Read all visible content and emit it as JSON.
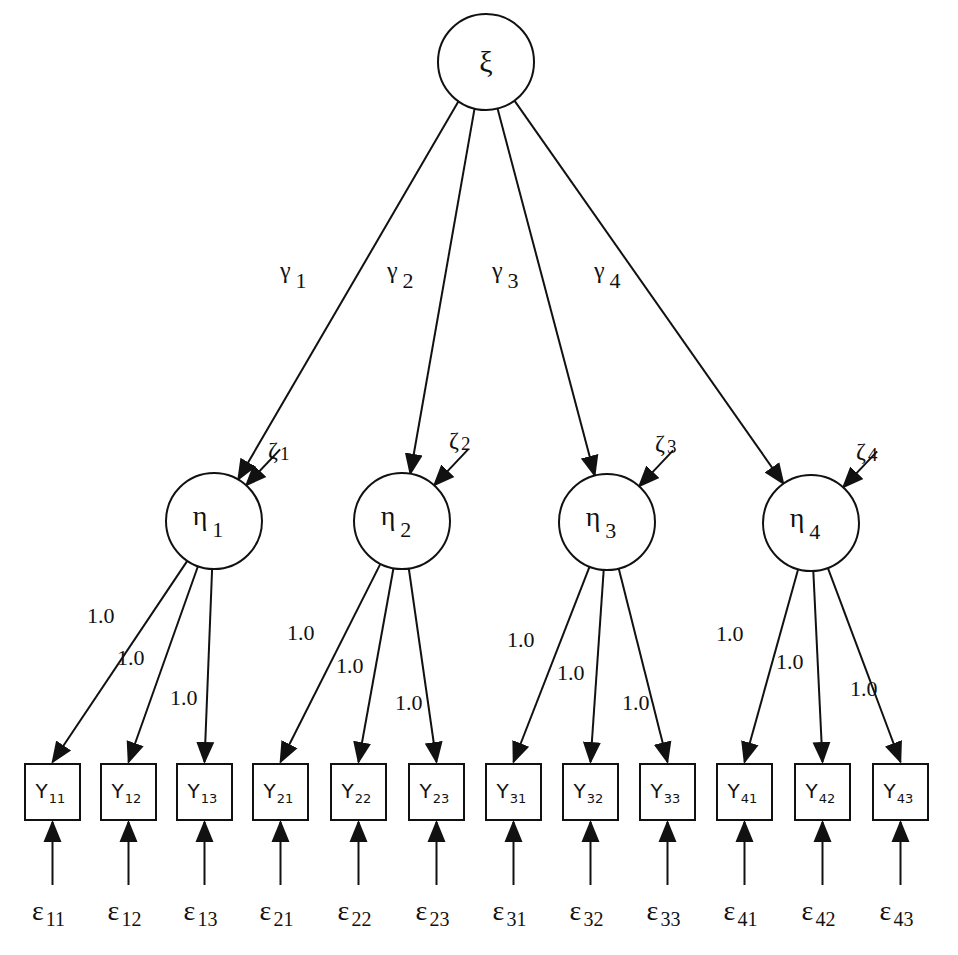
{
  "diagram": {
    "type": "second-order factor model (path diagram)",
    "higher_order_factor": {
      "id": "xi",
      "label": "ξ",
      "cx": 486,
      "cy": 62,
      "r": 48
    },
    "gamma_paths": [
      {
        "label": "γ",
        "sub": "1",
        "to": "eta1",
        "lx": 280,
        "ly": 278
      },
      {
        "label": "γ",
        "sub": "2",
        "to": "eta2",
        "lx": 387,
        "ly": 278
      },
      {
        "label": "γ",
        "sub": "3",
        "to": "eta3",
        "lx": 492,
        "ly": 278
      },
      {
        "label": "γ",
        "sub": "4",
        "to": "eta4",
        "lx": 594,
        "ly": 278
      }
    ],
    "first_order_factors": [
      {
        "id": "eta1",
        "label": "η",
        "sub": "1",
        "cx": 214,
        "cy": 521,
        "r": 48,
        "disturbance": {
          "label": "ζ",
          "sub": "1",
          "lx": 268,
          "ly": 458
        }
      },
      {
        "id": "eta2",
        "label": "η",
        "sub": "2",
        "cx": 402,
        "cy": 521,
        "r": 48,
        "disturbance": {
          "label": "ζ",
          "sub": "2",
          "lx": 449,
          "ly": 448
        }
      },
      {
        "id": "eta3",
        "label": "η",
        "sub": "3",
        "cx": 607,
        "cy": 522,
        "r": 48,
        "disturbance": {
          "label": "ζ",
          "sub": "3",
          "lx": 655,
          "ly": 451
        }
      },
      {
        "id": "eta4",
        "label": "η",
        "sub": "4",
        "cx": 811,
        "cy": 523,
        "r": 48,
        "disturbance": {
          "label": "ζ",
          "sub": "4",
          "lx": 856,
          "ly": 459
        }
      }
    ],
    "loadings": [
      {
        "from": "eta1",
        "to": "Y11",
        "label": "1.0",
        "lx": 87,
        "ly": 623
      },
      {
        "from": "eta1",
        "to": "Y12",
        "label": "1.0",
        "lx": 117,
        "ly": 665
      },
      {
        "from": "eta1",
        "to": "Y13",
        "label": "1.0",
        "lx": 170,
        "ly": 705
      },
      {
        "from": "eta2",
        "to": "Y21",
        "label": "1.0",
        "lx": 287,
        "ly": 640
      },
      {
        "from": "eta2",
        "to": "Y22",
        "label": "1.0",
        "lx": 336,
        "ly": 673
      },
      {
        "from": "eta2",
        "to": "Y23",
        "label": "1.0",
        "lx": 395,
        "ly": 710
      },
      {
        "from": "eta3",
        "to": "Y31",
        "label": "1.0",
        "lx": 507,
        "ly": 647
      },
      {
        "from": "eta3",
        "to": "Y32",
        "label": "1.0",
        "lx": 557,
        "ly": 680
      },
      {
        "from": "eta3",
        "to": "Y33",
        "label": "1.0",
        "lx": 622,
        "ly": 710
      },
      {
        "from": "eta4",
        "to": "Y41",
        "label": "1.0",
        "lx": 716,
        "ly": 641
      },
      {
        "from": "eta4",
        "to": "Y42",
        "label": "1.0",
        "lx": 776,
        "ly": 669
      },
      {
        "from": "eta4",
        "to": "Y43",
        "label": "1.0",
        "lx": 850,
        "ly": 696
      }
    ],
    "indicators": [
      {
        "id": "Y11",
        "label": "Y",
        "sub": "11",
        "x": 25,
        "eps": "ε",
        "eps_sub": "11"
      },
      {
        "id": "Y12",
        "label": "Y",
        "sub": "12",
        "x": 101,
        "eps": "ε",
        "eps_sub": "12"
      },
      {
        "id": "Y13",
        "label": "Y",
        "sub": "13",
        "x": 177,
        "eps": "ε",
        "eps_sub": "13"
      },
      {
        "id": "Y21",
        "label": "Y",
        "sub": "21",
        "x": 253,
        "eps": "ε",
        "eps_sub": "21"
      },
      {
        "id": "Y22",
        "label": "Y",
        "sub": "22",
        "x": 331,
        "eps": "ε",
        "eps_sub": "22"
      },
      {
        "id": "Y23",
        "label": "Y",
        "sub": "23",
        "x": 409,
        "eps": "ε",
        "eps_sub": "23"
      },
      {
        "id": "Y31",
        "label": "Y",
        "sub": "31",
        "x": 486,
        "eps": "ε",
        "eps_sub": "31"
      },
      {
        "id": "Y32",
        "label": "Y",
        "sub": "32",
        "x": 563,
        "eps": "ε",
        "eps_sub": "32"
      },
      {
        "id": "Y33",
        "label": "Y",
        "sub": "33",
        "x": 640,
        "eps": "ε",
        "eps_sub": "33"
      },
      {
        "id": "Y41",
        "label": "Y",
        "sub": "41",
        "x": 717,
        "eps": "ε",
        "eps_sub": "41"
      },
      {
        "id": "Y42",
        "label": "Y",
        "sub": "42",
        "x": 795,
        "eps": "ε",
        "eps_sub": "42"
      },
      {
        "id": "Y43",
        "label": "Y",
        "sub": "43",
        "x": 873,
        "eps": "ε",
        "eps_sub": "43"
      }
    ],
    "box_geometry": {
      "top": 764,
      "width": 55,
      "height": 56
    },
    "error_geometry": {
      "arrow_start_y": 885,
      "arrow_end_y": 822,
      "label_y": 920
    },
    "colors": {
      "stroke": "#111111",
      "background": "#ffffff"
    }
  }
}
